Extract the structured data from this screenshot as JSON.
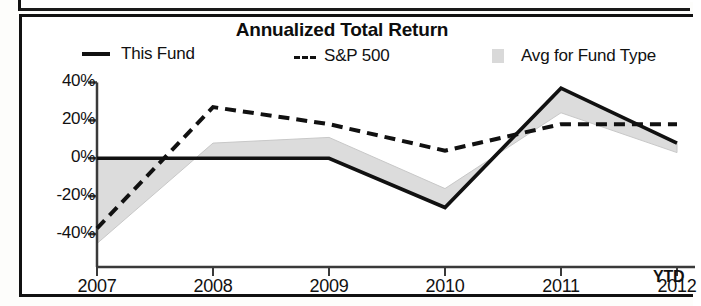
{
  "chart_data": {
    "type": "line",
    "title": "Annualized Total Return",
    "xlabel": "",
    "ylabel": "",
    "x": [
      "2007",
      "2008",
      "2009",
      "2010",
      "2011",
      "2012"
    ],
    "categories": [
      "2007",
      "2008",
      "2009",
      "2010",
      "2011",
      "2012"
    ],
    "x_note": "YTD",
    "ylim": [
      -50,
      45
    ],
    "yticks": [
      40,
      20,
      0,
      -20,
      -40
    ],
    "ytick_labels": [
      "40%",
      "20%",
      "0%",
      "-20%",
      "-40%"
    ],
    "grid": false,
    "legend_position": "top",
    "series": [
      {
        "name": "This Fund",
        "style": "solid-line",
        "color": "#111111",
        "values": [
          0,
          0,
          0,
          -26,
          37,
          8
        ]
      },
      {
        "name": "S&P 500",
        "style": "dashed-line",
        "color": "#111111",
        "values": [
          -37,
          27,
          18,
          4,
          18,
          18
        ]
      },
      {
        "name": "Avg for Fund Type",
        "style": "filled-area",
        "color": "#d9d9d9",
        "values": [
          -45,
          8,
          11,
          -16,
          24,
          3
        ]
      }
    ]
  },
  "chart": {
    "title": "Annualized Total Return",
    "ytd_note": "YTD",
    "accent_color": "#111111",
    "area_color": "#d9d9d9",
    "legend": [
      {
        "label": "This Fund",
        "marker": "solid-line-swatch"
      },
      {
        "label": "S&P 500",
        "marker": "dashed-line-swatch"
      },
      {
        "label": "Avg for Fund Type",
        "marker": "area-swatch"
      }
    ],
    "y_axis": {
      "labels": [
        "40%",
        "20%",
        "0%",
        "-20%",
        "-40%"
      ]
    },
    "x_axis": {
      "labels": [
        "2007",
        "2008",
        "2009",
        "2010",
        "2011",
        "2012"
      ]
    }
  }
}
